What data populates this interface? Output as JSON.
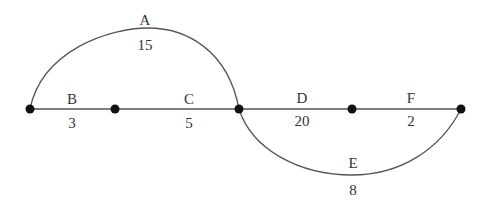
{
  "diagram": {
    "type": "network",
    "nodes": [
      {
        "id": "n1",
        "x": 30,
        "y": 109
      },
      {
        "id": "n2",
        "x": 115,
        "y": 109
      },
      {
        "id": "n3",
        "x": 239,
        "y": 109
      },
      {
        "id": "n4",
        "x": 352,
        "y": 109
      },
      {
        "id": "n5",
        "x": 461,
        "y": 109
      }
    ],
    "edges": [
      {
        "name": "A",
        "value": "15",
        "from": "n1",
        "to": "n3",
        "shape": "upper-arc"
      },
      {
        "name": "B",
        "value": "3",
        "from": "n1",
        "to": "n2",
        "shape": "line"
      },
      {
        "name": "C",
        "value": "5",
        "from": "n2",
        "to": "n3",
        "shape": "line"
      },
      {
        "name": "D",
        "value": "20",
        "from": "n3",
        "to": "n4",
        "shape": "line"
      },
      {
        "name": "E",
        "value": "8",
        "from": "n3",
        "to": "n5",
        "shape": "lower-arc"
      },
      {
        "name": "F",
        "value": "2",
        "from": "n4",
        "to": "n5",
        "shape": "line"
      }
    ]
  }
}
